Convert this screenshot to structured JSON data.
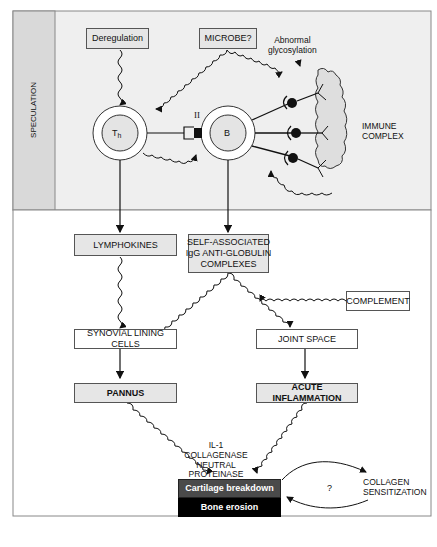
{
  "speculation_section": {
    "label": "SPECULATION",
    "deregulation": "Deregulation",
    "microbe": "MICROBE?",
    "abnormal_glycosylation": "Abnormal\nglycosylation",
    "th_cell": "Th",
    "th_sub": "h",
    "b_cell": "B",
    "mhc_label": "II",
    "immune_complex": "IMMUNE\nCOMPLEX"
  },
  "pathway": {
    "lymphokines": "LYMPHOKINES",
    "self_associated": "SELF-ASSOCIATED\nIgG ANTI-GLOBULIN\nCOMPLEXES",
    "complement": "COMPLEMENT",
    "synovial": "SYNOVIAL LINING CELLS",
    "joint_space": "JOINT SPACE",
    "pannus": "PANNUS",
    "acute_inflammation": "ACUTE INFLAMMATION",
    "mediators": "IL-1\nCOLLAGENASE\nNEUTRAL\nPROTEINASE",
    "cartilage": "Cartilage breakdown",
    "bone": "Bone erosion",
    "question": "?",
    "collagen": "COLLAGEN\nSENSITIZATION"
  },
  "colors": {
    "speculation_bg": "#efefef",
    "strip_bg": "#d9d9d9",
    "box_grey": "#e6e6e6",
    "cartilage_bg": "#4a4a4a",
    "bone_bg": "#000000"
  }
}
